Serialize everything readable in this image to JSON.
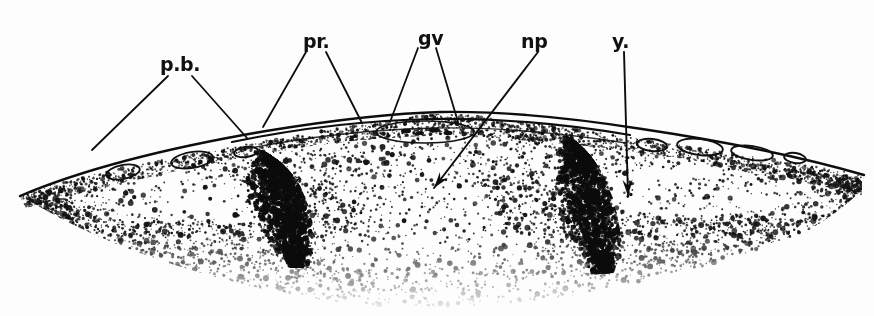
{
  "figure": {
    "domain": "scientific-illustration",
    "background_color": "#fdfdfd",
    "ink_color": "#101010",
    "width": 874,
    "height": 316,
    "caption_remnant": "•••"
  },
  "labels": [
    {
      "id": "pb",
      "text": "p.b.",
      "meaning": "presumptive blastocoel / peripheral band",
      "x": 160,
      "y": 55,
      "leaders": [
        {
          "x1": 168,
          "y1": 76,
          "x2": 92,
          "y2": 150
        },
        {
          "x1": 192,
          "y1": 76,
          "x2": 247,
          "y2": 138
        }
      ]
    },
    {
      "id": "pr",
      "text": "pr.",
      "meaning": "presumptive ridge",
      "x": 303,
      "y": 32,
      "leaders": [
        {
          "x1": 306,
          "y1": 52,
          "x2": 263,
          "y2": 127
        },
        {
          "x1": 326,
          "y1": 52,
          "x2": 362,
          "y2": 123
        }
      ]
    },
    {
      "id": "gv",
      "text": "gv",
      "meaning": "germinal vesicle",
      "x": 418,
      "y": 29,
      "leaders": [
        {
          "x1": 418,
          "y1": 48,
          "x2": 390,
          "y2": 122
        },
        {
          "x1": 436,
          "y1": 48,
          "x2": 458,
          "y2": 122
        }
      ]
    },
    {
      "id": "np",
      "text": "np",
      "meaning": "neural plate",
      "x": 521,
      "y": 32,
      "arrow": {
        "x1": 538,
        "y1": 52,
        "x2": 434,
        "y2": 188
      }
    },
    {
      "id": "y",
      "text": "y.",
      "meaning": "yolk",
      "x": 612,
      "y": 32,
      "arrow": {
        "x1": 624,
        "y1": 52,
        "x2": 628,
        "y2": 196
      }
    }
  ],
  "structures": {
    "outer_membrane": {
      "name": "outer surface membrane",
      "description": "Thin double-line contour running across the dome apex"
    },
    "vacuoles_left": {
      "name": "left peripheral vacuoles",
      "count": 3,
      "items": [
        {
          "cx": 123,
          "cy": 172,
          "rx": 17,
          "ry": 7,
          "rot": -11
        },
        {
          "cx": 192,
          "cy": 160,
          "rx": 21,
          "ry": 8,
          "rot": -9
        },
        {
          "cx": 246,
          "cy": 152,
          "rx": 12,
          "ry": 5,
          "rot": -8
        }
      ]
    },
    "vacuoles_right": {
      "name": "right peripheral vacuoles",
      "count": 4,
      "items": [
        {
          "cx": 652,
          "cy": 145,
          "rx": 15,
          "ry": 6,
          "rot": 6
        },
        {
          "cx": 700,
          "cy": 147,
          "rx": 23,
          "ry": 8,
          "rot": 7
        },
        {
          "cx": 752,
          "cy": 153,
          "rx": 21,
          "ry": 7,
          "rot": 8
        },
        {
          "cx": 795,
          "cy": 158,
          "rx": 11,
          "ry": 5,
          "rot": 9
        }
      ]
    },
    "apex_vesicle": {
      "name": "apical germinal vesicle",
      "cx": 425,
      "cy": 131,
      "rx": 48,
      "ry": 11
    },
    "dark_ridges": {
      "name": "dense pigment ridges",
      "count": 2,
      "positions": [
        290,
        560
      ]
    },
    "stipple": {
      "name": "yolk-granule stipple field",
      "description": "Dense random dot texture filling the interior, fading toward the lower margin"
    }
  }
}
